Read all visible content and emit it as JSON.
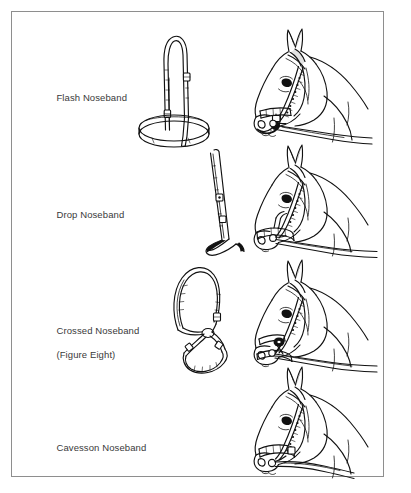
{
  "figure": {
    "background_color": "#ffffff",
    "border_color": "#8e8e8e",
    "ink_color": "#111111",
    "text_color": "#3a3a3a",
    "style": "black and white line drawing"
  },
  "rows": [
    {
      "id": "flash",
      "label": "Flash Noseband",
      "label_line1": "Flash Noseband",
      "label_line2": "",
      "tack_name": "flash-noseband-tack",
      "horse_name": "horse-head-flash",
      "has_reins": false
    },
    {
      "id": "drop",
      "label": "Drop Noseband",
      "label_line1": "Drop Noseband",
      "label_line2": "",
      "tack_name": "drop-noseband-tack",
      "horse_name": "horse-head-drop",
      "has_reins": true
    },
    {
      "id": "crossed",
      "label": "Crossed Noseband (Figure Eight)",
      "label_line1": "Crossed Noseband",
      "label_line2": "(Figure Eight)",
      "tack_name": "crossed-noseband-tack",
      "horse_name": "horse-head-crossed",
      "has_reins": true
    },
    {
      "id": "cavesson",
      "label": "Cavesson Noseband",
      "label_line1": "Cavesson Noseband",
      "label_line2": "",
      "tack_name": "cavesson-noseband-tack",
      "horse_name": "horse-head-cavesson",
      "has_reins": true
    }
  ]
}
